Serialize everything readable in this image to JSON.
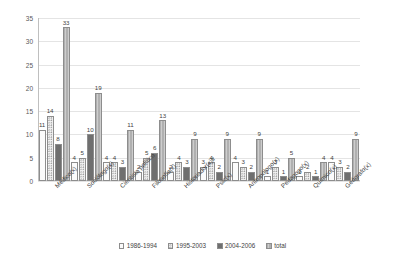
{
  "chart_data": {
    "type": "bar",
    "title": "",
    "subtitle": "",
    "xlabel": "",
    "ylabel": "",
    "ylim": [
      0,
      35
    ],
    "ytick_step": 5,
    "yticks": [
      "0",
      "5",
      "10",
      "15",
      "20",
      "25",
      "30",
      "35"
    ],
    "grid": "horizontal",
    "legend_position": "bottom-center",
    "orientation": "vertical",
    "grouped": true,
    "data_labels": true,
    "categories": [
      "Médico(x)",
      "Sociólogo(x)",
      "Cientista político",
      "Filosofía(x)",
      "Historiador(x)lr",
      "Psic(x)",
      "Antropólogo(x)",
      "Pedagogo(x)",
      "Químico(x)",
      "Geógrafo(x)"
    ],
    "series": [
      {
        "name": "1986-1994",
        "values": [
          11,
          4,
          4,
          2,
          2,
          3,
          4,
          1,
          1,
          4
        ]
      },
      {
        "name": "1995-2003",
        "values": [
          14,
          5,
          4,
          5,
          4,
          4,
          3,
          3,
          2,
          3
        ]
      },
      {
        "name": "2004-2006",
        "values": [
          8,
          10,
          3,
          6,
          3,
          2,
          2,
          1,
          1,
          2
        ]
      },
      {
        "name": "total",
        "values": [
          33,
          19,
          11,
          13,
          9,
          9,
          9,
          5,
          4,
          9
        ]
      }
    ],
    "series_styles": [
      "s0",
      "s1",
      "s2",
      "s3"
    ],
    "colors": {
      "series_1986_1994": "#fbfbfb",
      "series_1995_2003": "#f2f2f2",
      "series_2004_2006": "#6f6f6f",
      "series_total": "#b6b6b6",
      "gridline": "#e4e4e4",
      "axis": "#bfbfbf",
      "text": "#3f3f3f",
      "background": "#ffffff"
    }
  }
}
